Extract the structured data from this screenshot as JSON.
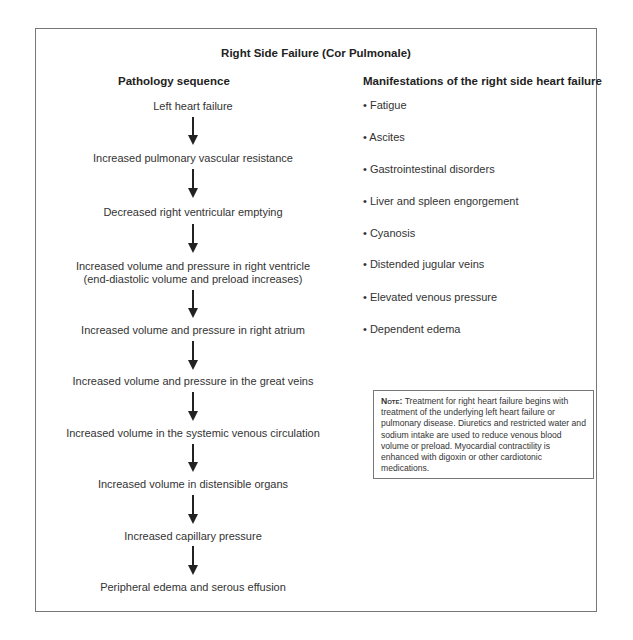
{
  "title": "Right Side Failure (Cor Pulmonale)",
  "left_column": {
    "heading": "Pathology sequence",
    "steps": [
      "Left heart failure",
      "Increased pulmonary vascular resistance",
      "Decreased right ventricular emptying",
      "Increased volume and pressure in right ventricle",
      "(end-diastolic volume and preload increases)",
      "Increased volume and pressure in right atrium",
      "Increased volume and pressure in the great veins",
      "Increased volume in the systemic venous circulation",
      "Increased volume in distensible organs",
      "Increased capillary pressure",
      "Peripheral edema and serous effusion"
    ]
  },
  "right_column": {
    "heading": "Manifestations of the right side heart failure",
    "items": [
      "• Fatigue",
      "• Ascites",
      "• Gastrointestinal disorders",
      "• Liver and spleen engorgement",
      "• Cyanosis",
      "• Distended jugular veins",
      "• Elevated venous pressure",
      "• Dependent edema"
    ]
  },
  "note": {
    "label": "Note:",
    "text": " Treatment for right heart failure begins with treatment of the underlying left heart failure or pulmonary disease. Diuretics and restricted water and sodium intake are used to reduce venous blood volume or preload. Myocardial contractility is enhanced with digoxin or other cardiotonic medications."
  }
}
